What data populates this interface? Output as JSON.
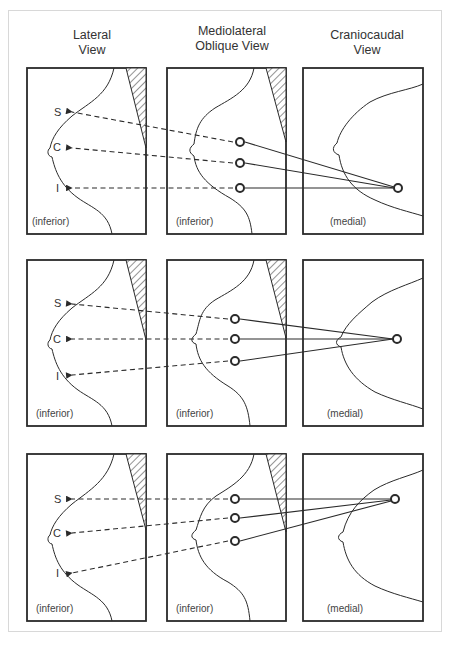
{
  "columns": [
    {
      "title": "Lateral\nView"
    },
    {
      "title": "Mediolateral\nOblique View"
    },
    {
      "title": "Craniocaudal\nView"
    }
  ],
  "rows": [
    {
      "labels": {
        "superior": "S",
        "central": "C",
        "inferior": "I"
      },
      "lateral_caption": "(inferior)",
      "mlo_caption": "(inferior)",
      "cc_caption": "(medial)"
    },
    {
      "labels": {
        "superior": "S",
        "central": "C",
        "inferior": "I"
      },
      "lateral_caption": "(inferior)",
      "mlo_caption": "(inferior)",
      "cc_caption": "(medial)"
    },
    {
      "labels": {
        "superior": "S",
        "central": "C",
        "inferior": "I"
      },
      "lateral_caption": "(inferior)",
      "mlo_caption": "(inferior)",
      "cc_caption": "(medial)"
    }
  ],
  "colors": {
    "line": "#2a2a2a",
    "text": "#333333",
    "border": "#d8d8d8"
  }
}
